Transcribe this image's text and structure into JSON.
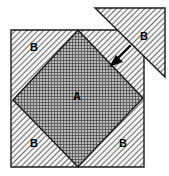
{
  "figure": {
    "canvas": {
      "width": 169,
      "height": 176,
      "background": "#ffffff"
    },
    "colors": {
      "outline": "#1a1a1a",
      "hatch_light_line": "#555555",
      "hatch_light_bg": "#f2f2f2",
      "hatch_dark_line": "#3a3a3a",
      "hatch_dark_bg": "#9a9a9a",
      "label": "#000000",
      "arrow": "#000000"
    },
    "shapes": {
      "outer_square": {
        "name": "outer-square",
        "fill_pattern": "diagonal-hatch-light",
        "points": "11,30 144,30 144,167 11,167"
      },
      "inner_diamond": {
        "name": "inner-diamond",
        "fill_pattern": "cross-hatch-dark",
        "points": "78,30 143,98 78,167 13,100"
      },
      "detached_triangle": {
        "name": "detached-triangle",
        "fill_pattern": "diagonal-hatch-light",
        "points": "95,8 165,8 165,77"
      },
      "arrow": {
        "name": "direction-arrow",
        "line": {
          "x1": 130,
          "y1": 46,
          "x2": 111,
          "y2": 65
        },
        "head": "111,65 121,61 117,57"
      }
    },
    "labels": [
      {
        "name": "label-region-a-center",
        "text": "A",
        "x": 77,
        "y": 97
      },
      {
        "name": "label-region-b-topleft",
        "text": "B",
        "x": 34,
        "y": 48
      },
      {
        "name": "label-region-b-botleft",
        "text": "B",
        "x": 34,
        "y": 144
      },
      {
        "name": "label-region-b-botright",
        "text": "B",
        "x": 123,
        "y": 144
      },
      {
        "name": "label-region-b-detached",
        "text": "B",
        "x": 144,
        "y": 37
      }
    ]
  }
}
